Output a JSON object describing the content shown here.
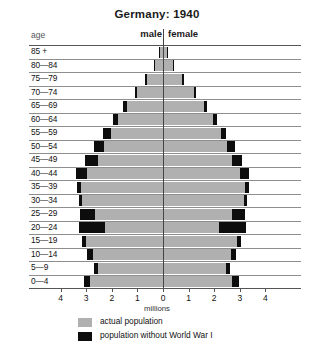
{
  "chart_data": {
    "type": "bar",
    "subtype": "population-pyramid",
    "title": "Germany: 1940",
    "xlabel": "millions",
    "ylabel": "age",
    "xlim": [
      -4,
      4
    ],
    "xticks": [
      4,
      3,
      2,
      1,
      0,
      1,
      2,
      3,
      4
    ],
    "grid": true,
    "legend_position": "bottom",
    "side_labels": {
      "left": "male",
      "right": "female"
    },
    "categories": [
      "0—4",
      "5—9",
      "10—14",
      "15—19",
      "20—24",
      "25—29",
      "30—34",
      "35—39",
      "40—44",
      "45—49",
      "50—54",
      "55—59",
      "60—64",
      "65—69",
      "70—74",
      "75—79",
      "80—84",
      "85 +"
    ],
    "series": [
      {
        "name": "actual population",
        "color": "#b0b0b0",
        "male": [
          2.85,
          2.55,
          2.75,
          3.0,
          2.25,
          2.65,
          3.15,
          3.2,
          2.95,
          2.55,
          2.3,
          2.05,
          1.75,
          1.4,
          1.0,
          0.62,
          0.3,
          0.12
        ],
        "female": [
          2.7,
          2.45,
          2.65,
          2.9,
          2.2,
          2.7,
          3.15,
          3.2,
          3.0,
          2.7,
          2.5,
          2.25,
          1.95,
          1.6,
          1.2,
          0.75,
          0.38,
          0.15
        ]
      },
      {
        "name": "population without World War I",
        "color": "#0d0d0d",
        "male": [
          3.1,
          2.7,
          2.95,
          3.15,
          3.3,
          3.25,
          3.3,
          3.35,
          3.4,
          3.05,
          2.7,
          2.35,
          1.95,
          1.55,
          1.1,
          0.7,
          0.35,
          0.15
        ],
        "female": [
          2.95,
          2.6,
          2.85,
          3.05,
          3.25,
          3.2,
          3.3,
          3.35,
          3.35,
          3.1,
          2.8,
          2.45,
          2.1,
          1.72,
          1.28,
          0.82,
          0.42,
          0.18
        ]
      }
    ]
  },
  "header": {
    "age_label": "age",
    "male_label": "male",
    "female_label": "female"
  },
  "axis": {
    "title": "millions",
    "tick_labels": [
      "4",
      "3",
      "2",
      "1",
      "0",
      "1",
      "2",
      "3",
      "4"
    ]
  },
  "legend": {
    "items": [
      {
        "label": "actual population",
        "color": "#b0b0b0"
      },
      {
        "label": "population without World War I",
        "color": "#0d0d0d"
      }
    ]
  },
  "caption": {
    "text": ""
  }
}
